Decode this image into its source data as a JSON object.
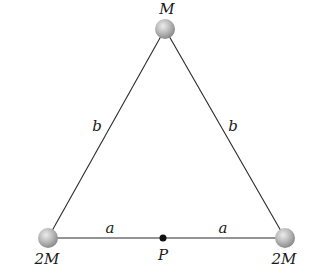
{
  "diagram": {
    "masses": {
      "top": {
        "label": "M",
        "x": 165,
        "y": 29
      },
      "bottom_left": {
        "label": "2M",
        "x": 48,
        "y": 238
      },
      "bottom_right": {
        "label": "2M",
        "x": 285,
        "y": 238
      }
    },
    "point_p": {
      "label": "P",
      "x": 163,
      "y": 238
    },
    "sides": {
      "left": {
        "label": "b"
      },
      "right": {
        "label": "b"
      },
      "base_left": {
        "label": "a"
      },
      "base_right": {
        "label": "a"
      }
    },
    "colors": {
      "line": "#2a2a2a",
      "sphere_light": "#e8e8e8",
      "sphere_dark": "#8f8f8f",
      "point": "#111111",
      "text": "#1a1a1a"
    }
  }
}
